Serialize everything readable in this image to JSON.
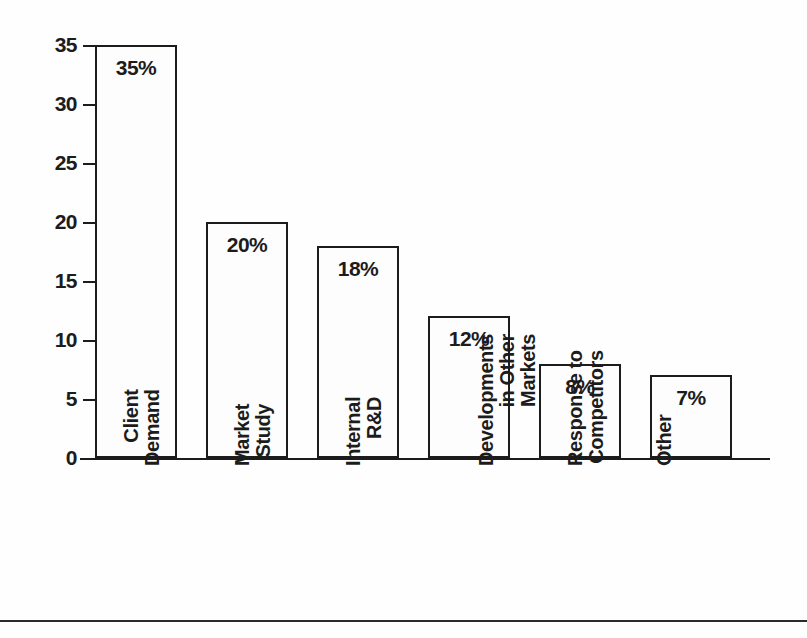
{
  "chart_data": {
    "type": "bar",
    "title": "",
    "xlabel": "",
    "ylabel": "",
    "categories": [
      "Client Demand",
      "Market Study",
      "Internal R&D",
      "Developments in Other Markets",
      "Response to Competitors",
      "Other"
    ],
    "category_lines": [
      [
        "Client",
        "Demand"
      ],
      [
        "Market",
        "Study"
      ],
      [
        "Internal",
        "R&D"
      ],
      [
        "Developments",
        "in Other",
        "Markets"
      ],
      [
        "Response to",
        "Competitors"
      ],
      [
        "Other"
      ]
    ],
    "values": [
      35,
      20,
      18,
      12,
      8,
      7
    ],
    "data_labels": [
      "35%",
      "20%",
      "18%",
      "12%",
      "8%",
      "7%"
    ],
    "ylim": [
      0,
      35
    ],
    "ytick_values": [
      0,
      5,
      10,
      15,
      20,
      25,
      30,
      35
    ],
    "ytick_labels": [
      "0",
      "5",
      "10",
      "15",
      "20",
      "25",
      "30",
      "35"
    ],
    "grid": false,
    "legend": null,
    "orientation": "vertical",
    "bar_fill_color": "#fdfdfd",
    "bar_edge_color": "#1c1c1c",
    "axis_color": "#1c1c1c",
    "background_color": "#ffffff",
    "label_rotation_degrees": 90
  },
  "figure": {
    "bottom_rule_color": "#2a2a2a"
  }
}
